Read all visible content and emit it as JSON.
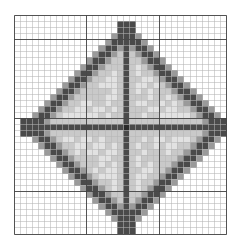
{
  "figure": {
    "width": 244,
    "height": 251,
    "background_color": "#ffffff"
  },
  "grid": {
    "origin_x": 13.5,
    "origin_y": 15.0,
    "cell_size": 6.07,
    "columns": 35,
    "rows": 36,
    "minor_line_color": "#b4b4b4",
    "minor_line_width": 1,
    "major_line_color": "#3c3c3c",
    "major_line_width": 1,
    "major_every": 12,
    "major_columns": [
      0,
      12,
      24,
      35
    ],
    "major_rows": [
      0,
      4,
      17,
      29,
      36
    ]
  },
  "shape": {
    "type": "diamond",
    "center_cell_x": 18,
    "center_cell_y": 18,
    "radius_cells": 15.5,
    "outline_color": "#4a4a4a",
    "outline_antialias_color": "#9a9a9a",
    "fill_color": "#c9c9c9",
    "fill_light_color": "#e2e2e2"
  },
  "cross": {
    "vertical_color": "#4a4a4a",
    "horizontal_color": "#4a4a4a",
    "thickness_cells": 1,
    "center_dot_color": "#2a2a2a"
  },
  "legend": {
    "visible": false
  },
  "chart_data": {
    "type": "heatmap",
    "xlabel": "",
    "ylabel": "",
    "grid": true,
    "legend_position": "none",
    "categories": [],
    "values": []
  }
}
